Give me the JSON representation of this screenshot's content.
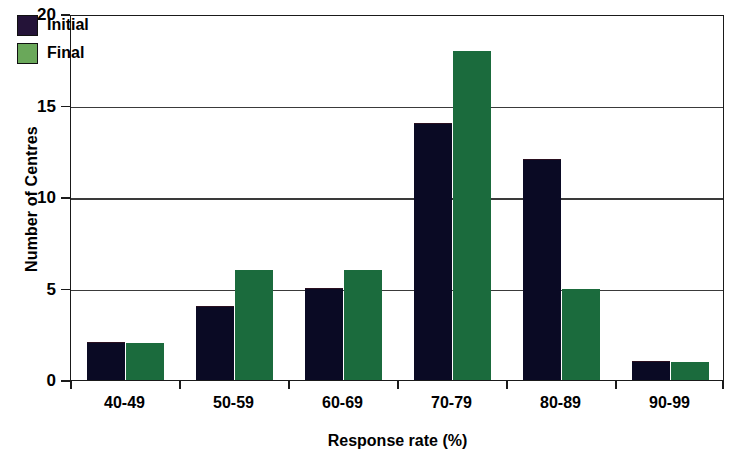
{
  "chart_data": {
    "type": "bar",
    "title": "",
    "xlabel": "Response rate (%)",
    "ylabel": "Number of Centres",
    "categories": [
      "40-49",
      "50-59",
      "60-69",
      "70-79",
      "80-89",
      "90-99"
    ],
    "series": [
      {
        "name": "Initial",
        "values": [
          2,
          4,
          5,
          14,
          12,
          1
        ],
        "color": "#0a0a24",
        "legend_color": "#241338"
      },
      {
        "name": "Final",
        "values": [
          2,
          6,
          6,
          18,
          5,
          1
        ],
        "color": "#1b6b3d",
        "legend_color": "#6aa85a"
      }
    ],
    "ylim": [
      0,
      20
    ],
    "yticks": [
      0,
      5,
      10,
      15,
      20
    ],
    "ytick_labels": [
      "0",
      "5",
      "10",
      "15",
      "20"
    ],
    "grid": "horizontal",
    "legend_position": "top-left",
    "bar_style": "grouped"
  },
  "legend": {
    "entries": [
      {
        "label": "Initial"
      },
      {
        "label": "Final"
      }
    ]
  },
  "axes": {
    "x_title": "Response rate (%)",
    "y_title": "Number of Centres"
  }
}
